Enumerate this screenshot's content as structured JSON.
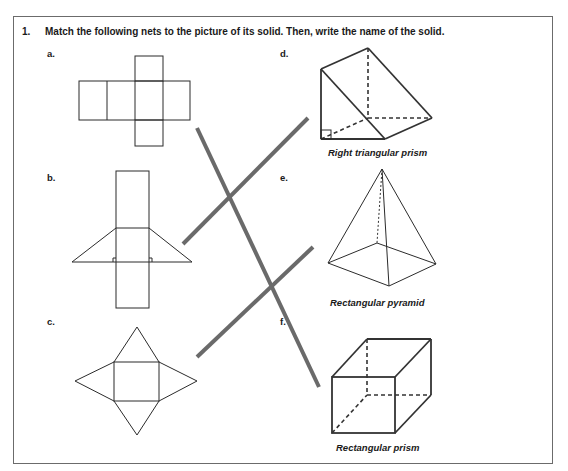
{
  "question": {
    "number": "1.",
    "prompt": "Match the following nets to the picture of its solid.  Then, write the name of the solid."
  },
  "nets": [
    {
      "letter": "a.",
      "shape": "cube-net"
    },
    {
      "letter": "b.",
      "shape": "triangular-prism-net"
    },
    {
      "letter": "c.",
      "shape": "rectangular-pyramid-net"
    }
  ],
  "solids": [
    {
      "letter": "d.",
      "name": "Right triangular prism"
    },
    {
      "letter": "e.",
      "name": "Rectangular pyramid"
    },
    {
      "letter": "f.",
      "name": "Rectangular prism"
    }
  ],
  "matches": [
    {
      "net": "a",
      "solid": "f"
    },
    {
      "net": "b",
      "solid": "d"
    },
    {
      "net": "c",
      "solid": "e"
    }
  ],
  "colors": {
    "border": "#6b6b6b",
    "match_line": "#6a6a6a",
    "ink": "#1a1a1a"
  }
}
